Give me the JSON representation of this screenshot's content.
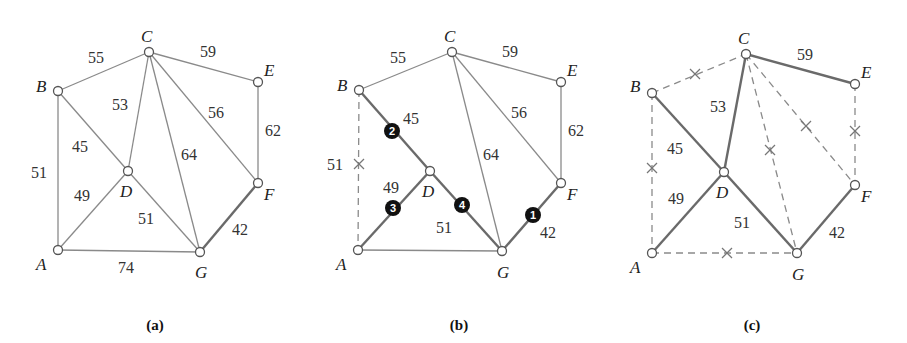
{
  "figure": {
    "panels": [
      {
        "id": "a",
        "caption": "(a)",
        "offset_x": 0,
        "nodes": {
          "A": {
            "x": 58,
            "y": 250,
            "lx": 36,
            "ly": 270
          },
          "B": {
            "x": 58,
            "y": 91,
            "lx": 36,
            "ly": 92
          },
          "C": {
            "x": 149,
            "y": 52,
            "lx": 141,
            "ly": 42
          },
          "D": {
            "x": 128,
            "y": 171,
            "lx": 120,
            "ly": 197
          },
          "E": {
            "x": 258,
            "y": 82,
            "lx": 264,
            "ly": 76
          },
          "F": {
            "x": 258,
            "y": 183,
            "lx": 264,
            "ly": 200
          },
          "G": {
            "x": 200,
            "y": 252,
            "lx": 195,
            "ly": 278
          }
        },
        "edges": [
          {
            "from": "B",
            "to": "C",
            "weight": "55",
            "style": "normal",
            "lx": 88,
            "ly": 63
          },
          {
            "from": "C",
            "to": "E",
            "weight": "59",
            "style": "normal",
            "lx": 200,
            "ly": 57
          },
          {
            "from": "C",
            "to": "D",
            "weight": "53",
            "style": "normal",
            "lx": 112,
            "ly": 110
          },
          {
            "from": "C",
            "to": "F",
            "weight": "56",
            "style": "normal",
            "lx": 208,
            "ly": 118
          },
          {
            "from": "E",
            "to": "F",
            "weight": "62",
            "style": "normal",
            "lx": 265,
            "ly": 136
          },
          {
            "from": "B",
            "to": "D",
            "weight": "45",
            "style": "normal",
            "lx": 72,
            "ly": 152
          },
          {
            "from": "C",
            "to": "G",
            "weight": "64",
            "style": "normal",
            "lx": 181,
            "ly": 160
          },
          {
            "from": "B",
            "to": "A",
            "weight": "51",
            "style": "normal",
            "lx": 31,
            "ly": 178
          },
          {
            "from": "A",
            "to": "D",
            "weight": "49",
            "style": "normal",
            "lx": 74,
            "ly": 201
          },
          {
            "from": "D",
            "to": "G",
            "weight": "51",
            "style": "normal",
            "lx": 138,
            "ly": 224
          },
          {
            "from": "F",
            "to": "G",
            "weight": "42",
            "style": "bold",
            "lx": 232,
            "ly": 235
          },
          {
            "from": "A",
            "to": "G",
            "weight": "74",
            "style": "normal",
            "lx": 118,
            "ly": 273
          }
        ],
        "caption_pos": {
          "x": 155,
          "y": 330
        }
      },
      {
        "id": "b",
        "caption": "(b)",
        "offset_x": 300,
        "nodes": {
          "A": {
            "x": 358,
            "y": 250,
            "lx": 336,
            "ly": 270
          },
          "B": {
            "x": 359,
            "y": 90,
            "lx": 337,
            "ly": 91
          },
          "C": {
            "x": 452,
            "y": 52,
            "lx": 444,
            "ly": 42
          },
          "D": {
            "x": 430,
            "y": 171,
            "lx": 422,
            "ly": 197
          },
          "E": {
            "x": 561,
            "y": 82,
            "lx": 567,
            "ly": 76
          },
          "F": {
            "x": 561,
            "y": 183,
            "lx": 567,
            "ly": 200
          },
          "G": {
            "x": 502,
            "y": 251,
            "lx": 497,
            "ly": 278
          }
        },
        "edges": [
          {
            "from": "B",
            "to": "C",
            "weight": "55",
            "style": "normal",
            "lx": 390,
            "ly": 63
          },
          {
            "from": "C",
            "to": "E",
            "weight": "59",
            "style": "normal",
            "lx": 502,
            "ly": 57
          },
          {
            "from": "C",
            "to": "F",
            "weight": "56",
            "style": "normal",
            "lx": 511,
            "ly": 118
          },
          {
            "from": "E",
            "to": "F",
            "weight": "62",
            "style": "normal",
            "lx": 568,
            "ly": 136
          },
          {
            "from": "B",
            "to": "D",
            "weight": "45",
            "style": "bold",
            "lx": 403,
            "ly": 124
          },
          {
            "from": "C",
            "to": "G",
            "weight": "64",
            "style": "normal",
            "lx": 483,
            "ly": 160
          },
          {
            "from": "B",
            "to": "A",
            "weight": "51",
            "style": "dashed",
            "lx": 327,
            "ly": 170,
            "xmark": {
              "x": 359,
              "y": 164
            }
          },
          {
            "from": "A",
            "to": "D",
            "weight": "49",
            "style": "bold",
            "lx": 383,
            "ly": 193
          },
          {
            "from": "D",
            "to": "G",
            "weight": "51",
            "style": "bold",
            "lx": 436,
            "ly": 233
          },
          {
            "from": "F",
            "to": "G",
            "weight": "42",
            "style": "bold",
            "lx": 540,
            "ly": 238
          },
          {
            "from": "A",
            "to": "G",
            "weight": "",
            "style": "normal",
            "lx": 0,
            "ly": 0
          }
        ],
        "order_badges": [
          {
            "label": "1",
            "x": 533,
            "y": 215
          },
          {
            "label": "2",
            "x": 392,
            "y": 131
          },
          {
            "label": "3",
            "x": 393,
            "y": 208
          },
          {
            "label": "4",
            "x": 462,
            "y": 205
          }
        ],
        "caption_pos": {
          "x": 459,
          "y": 330
        }
      },
      {
        "id": "c",
        "caption": "(c)",
        "offset_x": 600,
        "nodes": {
          "A": {
            "x": 652,
            "y": 253,
            "lx": 630,
            "ly": 273
          },
          "B": {
            "x": 652,
            "y": 93,
            "lx": 630,
            "ly": 92
          },
          "C": {
            "x": 746,
            "y": 54,
            "lx": 738,
            "ly": 44
          },
          "D": {
            "x": 724,
            "y": 172,
            "lx": 716,
            "ly": 198
          },
          "E": {
            "x": 855,
            "y": 84,
            "lx": 861,
            "ly": 78
          },
          "F": {
            "x": 855,
            "y": 185,
            "lx": 861,
            "ly": 202
          },
          "G": {
            "x": 797,
            "y": 253,
            "lx": 792,
            "ly": 280
          }
        },
        "edges": [
          {
            "from": "B",
            "to": "C",
            "weight": "",
            "style": "dashed",
            "lx": 0,
            "ly": 0,
            "xmark": {
              "x": 695,
              "y": 74
            }
          },
          {
            "from": "C",
            "to": "E",
            "weight": "59",
            "style": "bold",
            "lx": 797,
            "ly": 60
          },
          {
            "from": "C",
            "to": "D",
            "weight": "53",
            "style": "bold",
            "lx": 710,
            "ly": 112
          },
          {
            "from": "C",
            "to": "F",
            "weight": "",
            "style": "dashed",
            "lx": 0,
            "ly": 0,
            "xmark": {
              "x": 806,
              "y": 126
            }
          },
          {
            "from": "E",
            "to": "F",
            "weight": "",
            "style": "dashed",
            "lx": 0,
            "ly": 0,
            "xmark": {
              "x": 855,
              "y": 131
            }
          },
          {
            "from": "B",
            "to": "D",
            "weight": "45",
            "style": "bold",
            "lx": 667,
            "ly": 154
          },
          {
            "from": "C",
            "to": "G",
            "weight": "",
            "style": "dashed",
            "lx": 0,
            "ly": 0,
            "xmark": {
              "x": 770,
              "y": 150
            }
          },
          {
            "from": "B",
            "to": "A",
            "weight": "",
            "style": "dashed",
            "lx": 0,
            "ly": 0,
            "xmark": {
              "x": 652,
              "y": 168
            }
          },
          {
            "from": "A",
            "to": "D",
            "weight": "49",
            "style": "bold",
            "lx": 668,
            "ly": 204
          },
          {
            "from": "D",
            "to": "G",
            "weight": "51",
            "style": "bold",
            "lx": 734,
            "ly": 228
          },
          {
            "from": "F",
            "to": "G",
            "weight": "42",
            "style": "bold",
            "lx": 829,
            "ly": 238
          },
          {
            "from": "A",
            "to": "G",
            "weight": "",
            "style": "dashed",
            "lx": 0,
            "ly": 0,
            "xmark": {
              "x": 727,
              "y": 253
            }
          }
        ],
        "caption_pos": {
          "x": 752,
          "y": 330
        }
      }
    ]
  }
}
